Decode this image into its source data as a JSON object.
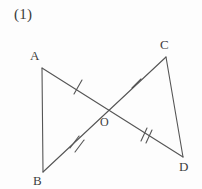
{
  "figure": {
    "problem_number": "(1)",
    "stroke_color": "#555555",
    "label_color": "#3d3d3d",
    "background_color": "#fdfdfd",
    "width": 202,
    "height": 189,
    "points": [
      {
        "name": "A",
        "label": "A",
        "x": 42,
        "y": 68,
        "label_x": 30,
        "label_y": 49
      },
      {
        "name": "B",
        "label": "B",
        "x": 43,
        "y": 172,
        "label_x": 33,
        "label_y": 174
      },
      {
        "name": "C",
        "label": "C",
        "x": 166,
        "y": 57,
        "label_x": 160,
        "label_y": 38
      },
      {
        "name": "D",
        "label": "D",
        "x": 183,
        "y": 157,
        "label_x": 179,
        "label_y": 160
      },
      {
        "name": "O",
        "label": "O",
        "x": 108,
        "y": 110,
        "label_x": 100,
        "label_y": 116
      }
    ],
    "segments": [
      {
        "name": "segment-AB",
        "from": "A",
        "to": "B",
        "x1": 42,
        "y1": 68,
        "x2": 43,
        "y2": 172
      },
      {
        "name": "segment-AO",
        "from": "A",
        "to": "O",
        "x1": 42,
        "y1": 68,
        "x2": 108,
        "y2": 110,
        "ticks": 1,
        "tick_x": 78,
        "tick_y": 87
      },
      {
        "name": "segment-OD",
        "from": "O",
        "to": "D",
        "x1": 108,
        "y1": 110,
        "x2": 183,
        "y2": 157,
        "ticks": 2,
        "tick_x": 146,
        "tick_y": 134
      },
      {
        "name": "segment-CO",
        "from": "C",
        "to": "O",
        "x1": 166,
        "y1": 57,
        "x2": 108,
        "y2": 110,
        "ticks": 1,
        "tick_x": 137,
        "tick_y": 84
      },
      {
        "name": "segment-OB",
        "from": "O",
        "to": "B",
        "x1": 108,
        "y1": 110,
        "x2": 43,
        "y2": 172,
        "ticks": 2,
        "tick_x": 76,
        "tick_y": 141
      },
      {
        "name": "segment-CD",
        "from": "C",
        "to": "D",
        "x1": 166,
        "y1": 57,
        "x2": 183,
        "y2": 157
      }
    ],
    "tick_marks": [
      {
        "name": "tick-AO",
        "segment": "segment-AO",
        "count": 1,
        "x": 78,
        "y": 87
      },
      {
        "name": "tick-CO",
        "segment": "segment-CO",
        "count": 1,
        "x": 137,
        "y": 84
      },
      {
        "name": "tick-OB",
        "segment": "segment-OB",
        "count": 2,
        "x": 76,
        "y": 141
      },
      {
        "name": "tick-OD",
        "segment": "segment-OD",
        "count": 2,
        "x": 146,
        "y": 134
      }
    ]
  }
}
